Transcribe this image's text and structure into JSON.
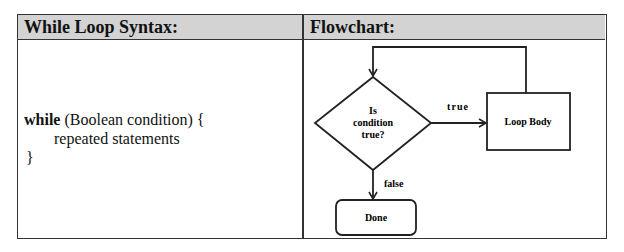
{
  "table": {
    "headers": [
      "While Loop Syntax:",
      "Flowchart:"
    ],
    "header_bg": "#d3d3d3"
  },
  "syntax": {
    "keyword": "while",
    "line1_rest": " (Boolean condition) {",
    "line2": "repeated statements",
    "line3": "}"
  },
  "flowchart": {
    "decision": [
      "Is",
      "condition",
      "true?"
    ],
    "true_label": "true",
    "false_label": "false",
    "loop_body": "Loop Body",
    "done": "Done"
  }
}
